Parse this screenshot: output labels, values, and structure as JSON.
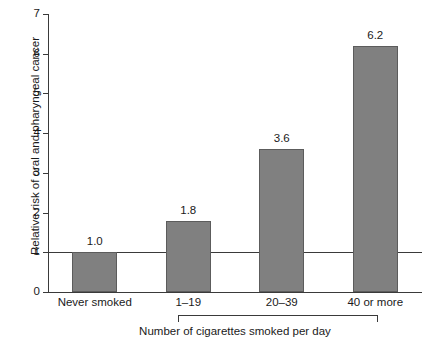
{
  "chart_data": {
    "type": "bar",
    "title": "",
    "xlabel": "Number of cigarettes smoked per day",
    "ylabel": "Relative risk of oral and pharyngeal cancer",
    "categories": [
      "Never smoked",
      "1–19",
      "20–39",
      "40 or more"
    ],
    "values": [
      1.0,
      1.8,
      3.6,
      6.2
    ],
    "value_labels": [
      "1.0",
      "1.8",
      "3.6",
      "6.2"
    ],
    "ylim": [
      0,
      7
    ],
    "yticks": [
      0,
      1,
      2,
      3,
      4,
      5,
      6,
      7
    ],
    "ytick_labels": [
      "0",
      "1",
      "2",
      "3",
      "4",
      "5",
      "6",
      "7"
    ],
    "grid": false,
    "legend": null,
    "reference_line": {
      "value": 1,
      "label": ""
    },
    "group_bracket": {
      "spans": [
        "1–19",
        "20–39",
        "40 or more"
      ],
      "caption": "Number of cigarettes smoked per day"
    },
    "bar_color": "#808080",
    "bar_edge_color": "#5c5c5c",
    "axis_color": "#3a3a3a",
    "background_color": "#ffffff"
  }
}
